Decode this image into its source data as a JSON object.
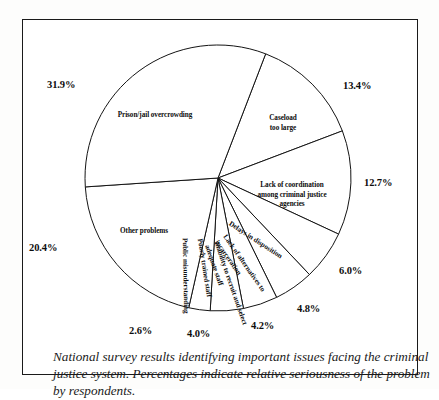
{
  "figure": {
    "caption": "National survey results identifying important issues facing the criminal justice system.  Percentages indicate relative seriousness of the problem by respondents."
  },
  "chart_data": {
    "type": "pie",
    "title": "",
    "xlabel": "",
    "ylabel": "",
    "legend_position": "none",
    "grid": false,
    "start_angle_deg": -69,
    "direction": "clockwise",
    "units": "percent",
    "categories": [
      "Caseload too large",
      "Lack of coordination among criminal justice agencies",
      "Delays in disposition",
      "Lack of alternatives to incarceration",
      "Inability to recruit and select adequate staff",
      "Poorly trained staff",
      "Public misunderstanding",
      "Other problems",
      "Prison/jail overcrowding"
    ],
    "values": [
      13.4,
      12.7,
      6.0,
      4.8,
      4.2,
      4.0,
      2.6,
      20.4,
      31.9
    ],
    "labels": [
      "13.4%",
      "12.7%",
      "6.0%",
      "4.8%",
      "4.2%",
      "4.0%",
      "2.6%",
      "20.4%",
      "31.9%"
    ],
    "slices": [
      {
        "name": "Caseload too large",
        "value": 13.4,
        "pct_label": "13.4%",
        "wedge_lines": [
          "Caseload",
          "too large"
        ]
      },
      {
        "name": "Lack of coordination among criminal justice agencies",
        "value": 12.7,
        "pct_label": "12.7%",
        "wedge_lines": [
          "Lack of coordination",
          "among criminal justice",
          "agencies"
        ]
      },
      {
        "name": "Delays in disposition",
        "value": 6.0,
        "pct_label": "6.0%",
        "wedge_lines": [
          "Delays in disposition"
        ]
      },
      {
        "name": "Lack of alternatives to incarceration",
        "value": 4.8,
        "pct_label": "4.8%",
        "wedge_lines": [
          "Lack of alternatives to",
          "incarceration"
        ]
      },
      {
        "name": "Inability to recruit and select adequate staff",
        "value": 4.2,
        "pct_label": "4.2%",
        "wedge_lines": [
          "Inability to recruit and select",
          "adequate staff"
        ]
      },
      {
        "name": "Poorly trained staff",
        "value": 4.0,
        "pct_label": "4.0%",
        "wedge_lines": [
          "Poorly trained staff"
        ]
      },
      {
        "name": "Public misunderstanding",
        "value": 2.6,
        "pct_label": "2.6%",
        "wedge_lines": [
          "Public misunderstanding"
        ]
      },
      {
        "name": "Other problems",
        "value": 20.4,
        "pct_label": "20.4%",
        "wedge_lines": [
          "Other problems"
        ]
      },
      {
        "name": "Prison/jail overcrowding",
        "value": 31.9,
        "pct_label": "31.9%",
        "wedge_lines": [
          "Prison/jail overcrowding"
        ]
      }
    ],
    "colors": {
      "slice_fill": "#ffffff",
      "slice_stroke": "#141414",
      "text": "#0d0d0d",
      "background": "#ffffff"
    }
  }
}
